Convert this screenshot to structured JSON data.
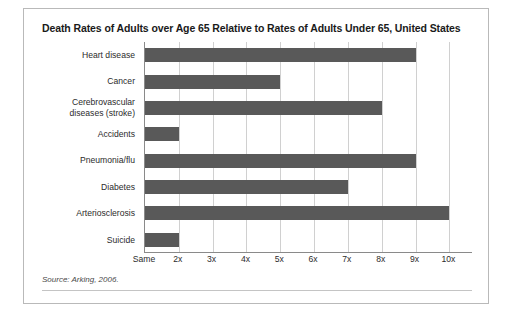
{
  "figure": {
    "title": "Death Rates of Adults over Age 65 Relative to Rates of Adults Under 65, United States",
    "source_note": "Source: Arking, 2006."
  },
  "chart_data": {
    "type": "bar",
    "orientation": "horizontal",
    "title": "Death Rates of Adults over Age 65 Relative to Rates of Adults Under 65, United States",
    "xlabel": "",
    "ylabel": "",
    "categories": [
      "Heart disease",
      "Cancer",
      "Cerebrovascular diseases (stroke)",
      "Accidents",
      "Pneumonia/flu",
      "Diabetes",
      "Arteriosclerosis",
      "Suicide"
    ],
    "values": [
      9,
      5,
      8,
      2,
      9,
      7,
      10,
      2
    ],
    "xlim": [
      1,
      10.7
    ],
    "xticks": [
      1,
      2,
      3,
      4,
      5,
      6,
      7,
      8,
      9,
      10
    ],
    "xticklabels": [
      "Same",
      "2x",
      "3x",
      "4x",
      "5x",
      "6x",
      "7x",
      "8x",
      "9x",
      "10x"
    ],
    "grid": true,
    "grid_axis": "x",
    "legend": false,
    "bar_color": "#595959",
    "units": "multiple of death rate of adults under 65"
  }
}
